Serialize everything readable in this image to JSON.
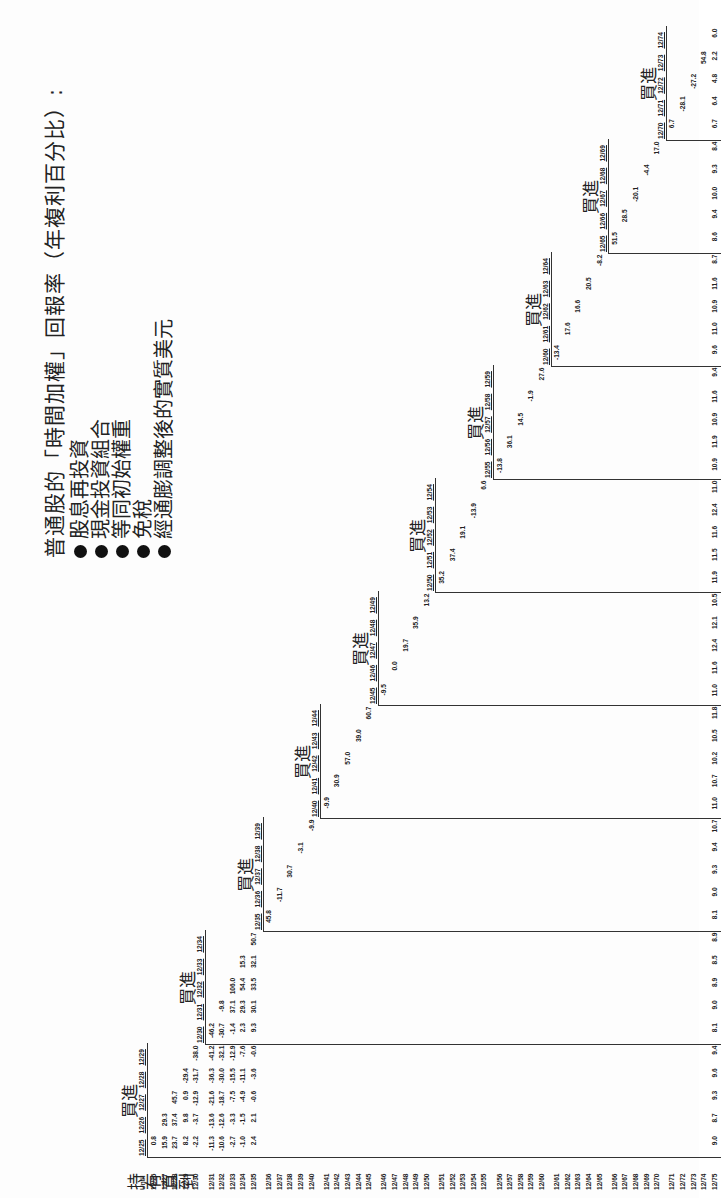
{
  "title": "普通股的「時間加權」回報率（年複利百分比）:",
  "bullets": [
    "股息再投資",
    "現金投資組合",
    "等同初始權重",
    "免稅",
    "經通膨調整後的實質美元"
  ],
  "corner_label": "持有直到",
  "buy_label": "買進",
  "until_label": "Until",
  "columns": [
    "12/25",
    "12/26",
    "12/27",
    "12/28",
    "12/29",
    "12/30",
    "12/31",
    "12/32",
    "12/33",
    "12/34",
    "12/35",
    "12/36",
    "12/37",
    "12/38",
    "12/39",
    "12/40",
    "12/41",
    "12/42",
    "12/43",
    "12/44",
    "12/45",
    "12/46",
    "12/47",
    "12/48",
    "12/49",
    "12/50",
    "12/51",
    "12/52",
    "12/53",
    "12/54",
    "12/55",
    "12/56",
    "12/57",
    "12/58",
    "12/59",
    "12/60",
    "12/61",
    "12/62",
    "12/63",
    "12/64",
    "12/65",
    "12/66",
    "12/67",
    "12/68",
    "12/69",
    "12/70",
    "12/71",
    "12/72",
    "12/73",
    "12/74"
  ],
  "rows": [
    "12/26",
    "12/27",
    "12/28",
    "12/29",
    "12/30",
    "12/31",
    "12/32",
    "12/33",
    "12/34",
    "12/35",
    "12/36",
    "12/37",
    "12/38",
    "12/39",
    "12/40",
    "12/41",
    "12/42",
    "12/43",
    "12/44",
    "12/45",
    "12/46",
    "12/47",
    "12/48",
    "12/49",
    "12/50",
    "12/51",
    "12/52",
    "12/53",
    "12/54",
    "12/55",
    "12/56",
    "12/57",
    "12/58",
    "12/59",
    "12/60",
    "12/61",
    "12/62",
    "12/63",
    "12/64",
    "12/65",
    "12/66",
    "12/67",
    "12/68",
    "12/69",
    "12/70",
    "12/71",
    "12/72",
    "12/73",
    "12/74",
    "12/75"
  ],
  "values": {
    "12/26": [
      "0.8"
    ],
    "12/27": [
      "15.9",
      "29.3"
    ],
    "12/28": [
      "23.7",
      "37.4",
      "45.7"
    ],
    "12/29": [
      "8.2",
      "9.8",
      "0.9",
      "-29.4"
    ],
    "12/30": [
      "-2.2",
      "-3.7",
      "-12.9",
      "-31.7",
      "-38.0"
    ],
    "12/31": [
      "-11.3",
      "-13.6",
      "-21.6",
      "-36.3",
      "-41.2",
      "-46.2"
    ],
    "12/32": [
      "-10.6",
      "-12.6",
      "-18.7",
      "-30.0",
      "-32.1",
      "-30.7",
      "-9.8"
    ],
    "12/33": [
      "-2.7",
      "-3.3",
      "-7.5",
      "-15.5",
      "-12.9",
      "-1.4",
      "37.1",
      "106.0"
    ],
    "12/34": [
      "-1.0",
      "-1.5",
      "-4.9",
      "-11.1",
      "-7.6",
      "2.3",
      "29.3",
      "54.4",
      "15.3"
    ],
    "12/35": [
      "2.4",
      "2.1",
      "-0.6",
      "-3.6",
      "-0.6",
      "9.3",
      "30.1",
      "33.5",
      "32.1",
      "50.7"
    ],
    "12/75": [
      "9.0",
      "8.7",
      "9.3",
      "9.6",
      "9.4",
      "8.1",
      "9.0",
      "8.9",
      "8.5",
      "8.9",
      "8.1",
      "9.0",
      "9.3",
      "9.4",
      "10.7",
      "11.0",
      "10.7",
      "10.2",
      "10.5",
      "11.8",
      "11.0",
      "11.6",
      "12.4",
      "12.1",
      "10.5",
      "11.9",
      "11.5",
      "11.6",
      "12.4",
      "11.0",
      "10.9",
      "11.9",
      "10.9",
      "11.6",
      "9.4",
      "9.6",
      "11.0",
      "10.9",
      "11.6",
      "8.7",
      "8.6",
      "9.4",
      "10.0",
      "9.3",
      "8.4",
      "6.7",
      "6.4",
      "4.8",
      "2.2",
      "6.0",
      "7.1",
      "5.0",
      "3.4",
      "16.9",
      "40.3",
      "40.1"
    ]
  },
  "last_row_label": "12/75",
  "last_row_values": [
    "9.0",
    "8.7",
    "9.3",
    "9.6",
    "9.4",
    "8.1",
    "9.0",
    "8.9",
    "8.5",
    "8.9",
    "8.1",
    "9.0",
    "9.3",
    "9.4",
    "10.7",
    "11.0",
    "10.7",
    "10.2",
    "10.5",
    "11.8",
    "11.0",
    "11.6",
    "12.4",
    "12.1",
    "10.5",
    "11.9",
    "11.5",
    "11.6",
    "12.4",
    "11.0",
    "10.9",
    "11.9",
    "10.9",
    "11.6",
    "9.4",
    "9.6",
    "11.0",
    "10.9",
    "11.6",
    "8.7",
    "9.6",
    "9.4",
    "10.0",
    "9.3",
    "8.4",
    "6.7",
    "6.4",
    "4.8",
    "2.2",
    "6.0"
  ],
  "diagonal_values": [
    "0.8",
    "29.3",
    "45.7",
    "-29.4",
    "-38.0",
    "-46.2",
    "-9.8",
    "106.0",
    "15.3",
    "50.7",
    "45.8",
    "-11.7",
    "30.7",
    "-3.1",
    "-9.9",
    "-9.9",
    "30.9",
    "57.0",
    "39.0",
    "60.7",
    "-9.5",
    "0.0",
    "19.7",
    "35.9",
    "13.2",
    "35.2",
    "37.4",
    "19.1",
    "-13.9",
    "6.6",
    "-13.8",
    "36.1",
    "14.5",
    "-1.9",
    "27.6",
    "-13.4",
    "17.6",
    "16.6",
    "20.5",
    "-8.2",
    "51.5",
    "28.5",
    "-20.1",
    "-4.4",
    "17.0",
    "6.7",
    "-28.1",
    "-27.2",
    "54.8",
    "40.1"
  ]
}
